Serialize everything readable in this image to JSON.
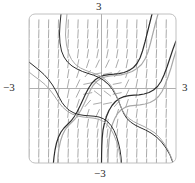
{
  "figure": {
    "name": "slope-field-plot",
    "background": "#ffffff"
  },
  "labels": {
    "top": "3",
    "bottom": "−3",
    "left": "−3",
    "right": "3"
  },
  "colors": {
    "frame": "#b9b9b9",
    "axis": "#9a9a9a",
    "field": "#8d8d8d",
    "curve_dark": "#2d2d2d",
    "curve_light": "#a8a8a8",
    "text": "#2b2b2b"
  },
  "chart_data": {
    "type": "line",
    "title": "",
    "subtitle": "",
    "xlabel": "",
    "ylabel": "",
    "xlim": [
      -3,
      3
    ],
    "ylim": [
      -3,
      3
    ],
    "grid": false,
    "legend": null,
    "axis_tick_labels": {
      "x": [
        "-3",
        "3"
      ],
      "y": [
        "-3",
        "3"
      ]
    },
    "plot_frame": {
      "x0": 29,
      "y0": 14,
      "x1": 176,
      "y1": 163,
      "corner_radius": 6
    },
    "axes_origin_px": {
      "x": 101.5,
      "y": 88.5
    },
    "slope_field": {
      "description": "Dashed tangent segments on a regular grid; slope = x^2 + y^2 - scaled, near-vertical away from origin, shallow near the center band",
      "cols": 15,
      "rows": 15,
      "x_start": -3,
      "x_step": 0.4,
      "y_start": -3,
      "y_step": 0.4,
      "dash_length_px": 9,
      "style": "dashed",
      "slope_formula": "dy/dx = 3*(x^2 + y^2) - 1"
    },
    "series": [
      {
        "name": "solution-curve-1",
        "color": "#2d2d2d",
        "width": 1.2,
        "points_px": "M 152 14 L 150 22 L 147.5 32 L 145 42 L 142.5 51 L 140 58 L 137 63.5 L 133.5 67.5 L 129 70.5 L 124 72.5 L 119 73.6 L 114 74.2 L 109 74.6 L 104 75.4 L 99.5 77 L 95.5 79.5 L 92 83 L 89 87.5 L 86 93 L 83 99.5 L 80 106 L 77 112 L 74 117 L 71 121 L 67.5 124.5 L 64 128 L 61 132 L 58.5 137 L 56.5 143 L 55 150 L 54 157 L 53.4 163"
      },
      {
        "name": "solution-curve-2",
        "color": "#a8a8a8",
        "width": 1.2,
        "points_px": "M 158 14 L 155.5 23 L 153 33 L 150.5 43 L 148 52 L 145 59 L 141.5 64.5 L 137 68.5 L 132 71.5 L 126.5 73.5 L 121 74.8 L 115.5 75.5 L 110 76 L 105 77 L 100.5 78.8 L 96.5 81.5 L 93 85.5 L 90 91 L 87 97.5 L 84 104 L 81 110 L 78 115 L 75 119 L 71.5 122.5 L 68 126 L 65 130 L 62.5 135 L 60.5 141 L 59 148 L 58 156 L 57.6 163"
      },
      {
        "name": "solution-curve-3",
        "color": "#2d2d2d",
        "width": 1.2,
        "points_px": "M 176 41 L 173 49 L 170 58 L 167 67 L 164 75 L 161 81.5 L 157.5 86.5 L 153.5 90 L 149 92.5 L 144 94 L 139 94.8 L 134 95.2 L 129 95.6 L 124 96.6 L 119.5 98.5 L 115.5 101.5 L 112 105.5 L 109 110.5 L 106.5 116.5 L 104.5 123 L 103 130 L 102.2 138 L 101.8 146 L 101.6 154 L 101.5 163"
      },
      {
        "name": "solution-curve-4",
        "color": "#a8a8a8",
        "width": 1.2,
        "points_px": "M 176 51 L 173.5 59 L 171 68 L 168 77 L 165 85 L 162 91.5 L 158.5 96.5 L 154.5 100 L 150 102.5 L 145 104 L 140 104.8 L 135 105.3 L 130 105.9 L 125.5 107.2 L 121.5 109.5 L 118 113 L 115 118 L 112.5 124 L 110.5 131 L 109.2 139 L 108.5 147 L 108.2 155 L 108 163"
      },
      {
        "name": "solution-curve-5",
        "color": "#2d2d2d",
        "width": 1.0,
        "points_px": "M 61 14 L 60 24 L 59.5 34 L 60 43 L 61.5 51 L 64 57 L 67.5 62 L 72 66 L 77 69 L 82.5 71.5 L 88 73.4 L 93.5 75.2 L 99 77.5 L 104 80.5 L 108.5 84.5 L 112.5 89.5 L 116 95.5 L 119 102 L 121.5 108.5 L 124 114 L 127 118.5 L 130.5 122 L 135 125 L 140 127.5 L 145.5 130 L 151 133 L 156.5 137 L 161.5 142 L 166 148 L 170 155 L 173 163"
      },
      {
        "name": "solution-curve-6",
        "color": "#a8a8a8",
        "width": 1.0,
        "points_px": "M 67 14 L 66 25 L 65.5 35 L 66.5 45 L 68.5 53 L 71.5 59.5 L 75.5 64.5 L 80.5 68 L 86 70.5 L 91.5 72.5 L 97 74.5 L 102 77 L 106.5 80.5 L 110.5 85 L 114 90.5 L 117 97 L 119.5 103.5 L 122 109.5 L 125 114.5 L 129 118.5 L 133.5 121.5 L 138.5 124 L 144 126.5 L 149.5 129.5 L 155 133 L 160 138 L 164.5 144 L 168.5 151 L 171.5 158 L 173.5 163"
      },
      {
        "name": "solution-curve-7",
        "color": "#2d2d2d",
        "width": 1.0,
        "points_px": "M 29 62 L 34 66 L 39 70 L 44 74.5 L 48.5 79.5 L 52.5 85 L 56 91 L 59 97 L 62 102.5 L 65.5 107 L 69.5 110.5 L 74 113 L 79 114.6 L 84 115.4 L 89 115.8 L 94 116.2 L 99 117 L 103.5 118.8 L 107.5 121.5 L 111 125.5 L 114 130.5 L 116.5 136.5 L 118.5 143 L 120 150 L 121 157 L 121.5 163"
      },
      {
        "name": "solution-curve-8",
        "color": "#a8a8a8",
        "width": 1.0,
        "points_px": "M 29 72 L 34 76 L 39.5 80 L 45 84.5 L 50 90 L 54.5 96 L 58.5 102 L 62.5 107 L 67 111 L 72 114 L 77.5 116 L 83 117 L 88.5 117.6 L 94 118.2 L 99 119.4 L 103.5 121.5 L 107.5 125 L 111 129.5 L 114 135 L 116.5 141.5 L 118.5 148.5 L 120 156 L 120.8 163"
      }
    ]
  }
}
